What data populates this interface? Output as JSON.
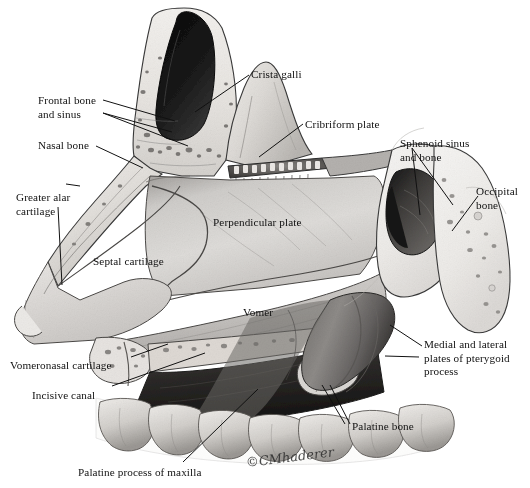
{
  "figure": {
    "background_color": "#ffffff",
    "ink_color": "#111111",
    "width": 530,
    "height": 488
  },
  "signature": {
    "text": "©CMhaderer",
    "x": 246,
    "y": 455
  },
  "labels": [
    {
      "id": "frontal-bone-and-sinus",
      "text": "Frontal bone\nand sinus",
      "x": 38,
      "y": 94,
      "align": "left"
    },
    {
      "id": "nasal-bone",
      "text": "Nasal bone",
      "x": 38,
      "y": 139,
      "align": "left"
    },
    {
      "id": "greater-alar-cartilage",
      "text": "Greater alar\ncartilage",
      "x": 16,
      "y": 191,
      "align": "left"
    },
    {
      "id": "septal-cartilage",
      "text": "Septal cartilage",
      "x": 93,
      "y": 255,
      "align": "left"
    },
    {
      "id": "vomeronasal-cartilage",
      "text": "Vomeronasal cartilage",
      "x": 10,
      "y": 359,
      "align": "left"
    },
    {
      "id": "incisive-canal",
      "text": "Incisive canal",
      "x": 32,
      "y": 389,
      "align": "left"
    },
    {
      "id": "palatine-process-of-maxilla",
      "text": "Palatine process of maxilla",
      "x": 78,
      "y": 466,
      "align": "left"
    },
    {
      "id": "crista-galli",
      "text": "Crista galli",
      "x": 251,
      "y": 68,
      "align": "left"
    },
    {
      "id": "cribriform-plate",
      "text": "Cribriform plate",
      "x": 305,
      "y": 118,
      "align": "left"
    },
    {
      "id": "perpendicular-plate",
      "text": "Perpendicular plate",
      "x": 213,
      "y": 216,
      "align": "left"
    },
    {
      "id": "vomer",
      "text": "Vomer",
      "x": 243,
      "y": 306,
      "align": "left"
    },
    {
      "id": "sphenoid-sinus-and-bone",
      "text": "Sphenoid sinus\nand bone",
      "x": 400,
      "y": 137,
      "align": "left"
    },
    {
      "id": "occipital-bone",
      "text": "Occipital\nbone",
      "x": 476,
      "y": 185,
      "align": "left"
    },
    {
      "id": "medial-and-lateral-plates-of-pterygoid-process",
      "text": "Medial and lateral\nplates of pterygoid\nprocess",
      "x": 424,
      "y": 338,
      "align": "left"
    },
    {
      "id": "palatine-bone",
      "text": "Palatine bone",
      "x": 352,
      "y": 420,
      "align": "left"
    }
  ],
  "leader_lines": [
    {
      "id": "leader-frontal-bone-1",
      "points": "103,100 175,121"
    },
    {
      "id": "leader-frontal-bone-2",
      "points": "103,113 188,146"
    },
    {
      "id": "leader-frontal-bone-3",
      "points": "103,113 172,132"
    },
    {
      "id": "leader-nasal-bone",
      "points": "96,146 143,168"
    },
    {
      "id": "leader-greater-alar",
      "points": "66,184 80,186"
    },
    {
      "id": "leader-greater-alar-2",
      "points": "58,207 62,285"
    },
    {
      "id": "leader-crista-galli",
      "points": "249,75 195,112"
    },
    {
      "id": "leader-cribriform",
      "points": "303,124 259,157"
    },
    {
      "id": "leader-sphenoid-1",
      "points": "412,148 420,215"
    },
    {
      "id": "leader-sphenoid-2",
      "points": "412,148 453,205"
    },
    {
      "id": "leader-occipital",
      "points": "478,196 452,231"
    },
    {
      "id": "leader-pterygoid-1",
      "points": "422,346 390,325"
    },
    {
      "id": "leader-pterygoid-2",
      "points": "419,357 385,356"
    },
    {
      "id": "leader-palatine-bone-1",
      "points": "350,424 330,385"
    },
    {
      "id": "leader-palatine-bone-2",
      "points": "345,424 322,385"
    },
    {
      "id": "leader-vomeronasal",
      "points": "131,357 168,344"
    },
    {
      "id": "leader-incisive-canal",
      "points": "112,386 205,353"
    },
    {
      "id": "leader-palatine-process",
      "points": "183,462 258,389"
    }
  ]
}
